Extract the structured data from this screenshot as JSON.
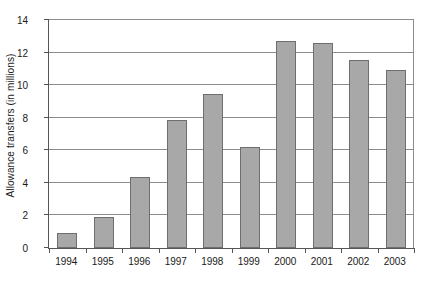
{
  "chart_data": {
    "type": "bar",
    "title": "",
    "xlabel": "",
    "ylabel": "Allowance transfers (in millions)",
    "categories": [
      "1994",
      "1995",
      "1996",
      "1997",
      "1998",
      "1999",
      "2000",
      "2001",
      "2002",
      "2003"
    ],
    "values": [
      0.9,
      1.9,
      4.35,
      7.85,
      9.45,
      6.2,
      12.7,
      12.6,
      11.55,
      10.95
    ],
    "ylim": [
      0,
      14
    ],
    "yticks": [
      0,
      2,
      4,
      6,
      8,
      10,
      12,
      14
    ],
    "ytick_labels": [
      "0",
      "2",
      "4",
      "6",
      "8",
      "10",
      "12",
      "14"
    ],
    "grid": true,
    "grid_axis": "y",
    "legend": false,
    "legend_position": "none",
    "bar_fill_color": "#a8a8a8",
    "bar_border_color": "#6e6e6e",
    "axis_color": "#555555",
    "gridline_color": "#8c8c8c",
    "background_color": "#ffffff",
    "text_color": "#1a1a1a"
  }
}
